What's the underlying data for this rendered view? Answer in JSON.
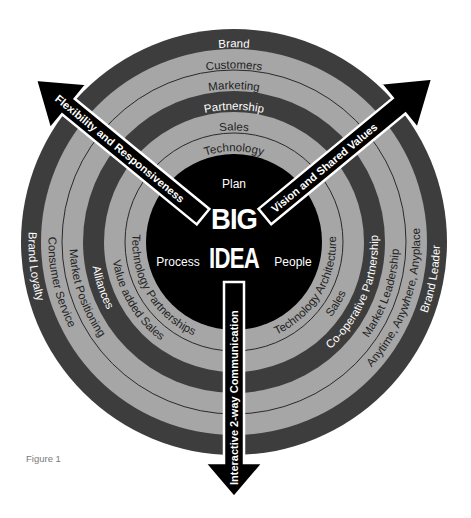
{
  "figure": {
    "caption": "Figure 1",
    "colors": {
      "dark_band": "#3d3d3d",
      "light_band": "#a6a6a6",
      "center": "#000000",
      "divider": "#2a2a2a",
      "arrow": "#000000"
    }
  },
  "center": {
    "title_line1": "BIG",
    "title_line2": "IDEA",
    "top": "Plan",
    "left": "Process",
    "right": "People"
  },
  "rings": [
    {
      "level": 1,
      "shade": "light",
      "top": "Technology",
      "left": "Technology Partnerships",
      "right": "Technology Architecture"
    },
    {
      "level": 2,
      "shade": "light",
      "top": "Sales",
      "left": "Value added Sales",
      "right": "Sales"
    },
    {
      "level": 3,
      "shade": "dark",
      "top": "Partnership",
      "left": "Alliances",
      "right": "Co-operative Partnership"
    },
    {
      "level": 4,
      "shade": "light",
      "top": "Marketing",
      "left": "Market Positioning",
      "right": "Market Leadership"
    },
    {
      "level": 5,
      "shade": "light",
      "top": "Customers",
      "left": "Consumer Service",
      "right": "Anytime, Anywhere, Anyplace"
    },
    {
      "level": 6,
      "shade": "dark",
      "top": "Brand",
      "left": "Brand Loyalty",
      "right": "Brand Leader"
    }
  ],
  "arrows": [
    {
      "direction": "upper-left",
      "label": "Flexibility and Responsiveness"
    },
    {
      "direction": "upper-right",
      "label": "Vision and Shared Values"
    },
    {
      "direction": "down",
      "label": "Interactive 2-way Communication"
    }
  ]
}
